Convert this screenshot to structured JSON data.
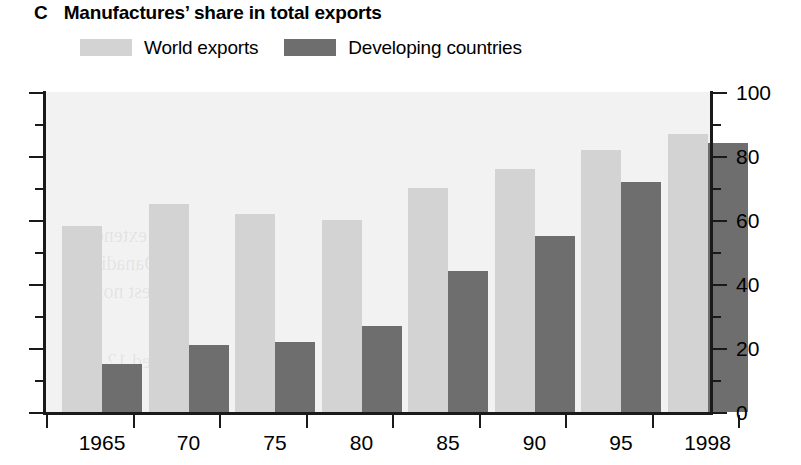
{
  "panel": {
    "letter": "C"
  },
  "header": {
    "title": "Manufactures’ share in total exports"
  },
  "legend": {
    "items": [
      {
        "label": "World exports",
        "color": "#d3d3d3",
        "swatch_name": "legend-swatch-world-exports"
      },
      {
        "label": "Developing countries",
        "color": "#6e6e6e",
        "swatch_name": "legend-swatch-developing-countries"
      }
    ]
  },
  "axes": {
    "y_ticks_major": [
      "0",
      "20",
      "40",
      "60",
      "80",
      "100"
    ],
    "y_minor_values": [
      10,
      30,
      50,
      70,
      90
    ],
    "x_labels": [
      "1965",
      "70",
      "75",
      "80",
      "85",
      "90",
      "95",
      "1998"
    ]
  },
  "ghost_text": [
    {
      "text": "extends",
      "x": 40,
      "y": 132
    },
    {
      "text": "Oanadian",
      "x": 36,
      "y": 160
    },
    {
      "text": "highest nore",
      "x": 42,
      "y": 188
    },
    {
      "text": "ed 12 p",
      "x": 46,
      "y": 258
    },
    {
      "text": "ni",
      "x": 52,
      "y": 290
    }
  ],
  "chart_data": {
    "type": "bar",
    "title": "Manufactures’ share in total exports",
    "xlabel": "",
    "ylabel": "",
    "ylim": [
      0,
      100
    ],
    "ytick_step": 20,
    "yminor_step": 10,
    "grid": false,
    "legend_position": "top-left",
    "categories": [
      "1965",
      "70",
      "75",
      "80",
      "85",
      "90",
      "95",
      "1998"
    ],
    "series": [
      {
        "name": "World exports",
        "color": "#d3d3d3",
        "values": [
          58,
          65,
          62,
          60,
          70,
          76,
          82,
          87
        ]
      },
      {
        "name": "Developing countries",
        "color": "#6e6e6e",
        "values": [
          15,
          21,
          22,
          27,
          44,
          55,
          72,
          84
        ]
      }
    ]
  }
}
